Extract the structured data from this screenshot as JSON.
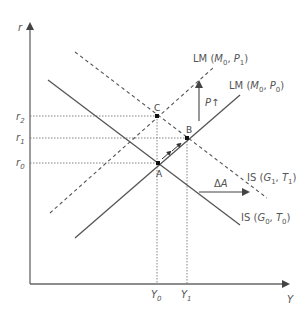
{
  "axes": {
    "y_label": "r",
    "x_label": "Y"
  },
  "interest_rates": [
    {
      "name": "r2",
      "base": "r",
      "sub": "2"
    },
    {
      "name": "r1",
      "base": "r",
      "sub": "1"
    },
    {
      "name": "r0",
      "base": "r",
      "sub": "0"
    }
  ],
  "outputs": [
    {
      "name": "Y0",
      "base": "Y",
      "sub": "0"
    },
    {
      "name": "Y1",
      "base": "Y",
      "sub": "1"
    }
  ],
  "points": {
    "A": "A",
    "B": "B",
    "C": "C"
  },
  "curves": {
    "lm_p1": {
      "prefix": "LM",
      "open": " (",
      "a": "M",
      "a_sub": "0",
      "sep": ", ",
      "b": "P",
      "b_sub": "1",
      "close": ")",
      "style": "dashed"
    },
    "lm_p0": {
      "prefix": "LM",
      "open": " (",
      "a": "M",
      "a_sub": "0",
      "sep": ", ",
      "b": "P",
      "b_sub": "0",
      "close": ")",
      "style": "solid"
    },
    "is_g1": {
      "prefix": "IS",
      "open": " (",
      "a": "G",
      "a_sub": "1",
      "sep": ", ",
      "b": "T",
      "b_sub": "1",
      "close": ")",
      "style": "dashed"
    },
    "is_g0": {
      "prefix": "IS",
      "open": " (",
      "a": "G",
      "a_sub": "0",
      "sep": ", ",
      "b": "T",
      "b_sub": "0",
      "close": ")",
      "style": "solid"
    }
  },
  "annotations": {
    "price_rise": {
      "base": "P",
      "arrow": "↑"
    },
    "demand_shift": {
      "delta": "Δ",
      "base": "A"
    }
  },
  "colors": {
    "line": "#555555",
    "axis": "#666666",
    "guide": "#777777",
    "text": "#555555"
  }
}
